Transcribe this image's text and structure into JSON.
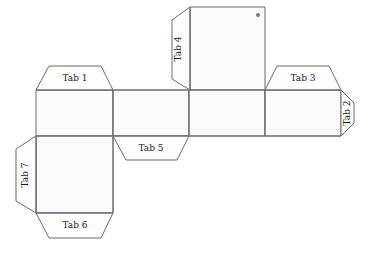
{
  "diagram": {
    "type": "papercraft-net",
    "colors": {
      "stroke": "#6b6b6b",
      "face_fill": "#fbfbfb",
      "tab_fill": "#fefefe",
      "label_text": "#1a1a1a",
      "marker_dot": "#7a7a7a",
      "background": "#ffffff"
    },
    "tabs": [
      {
        "id": "tab-1",
        "label": "Tab 1",
        "orientation": "horizontal",
        "position": "top-of-left-face"
      },
      {
        "id": "tab-2",
        "label": "Tab 2",
        "orientation": "vertical",
        "position": "right-of-right-face"
      },
      {
        "id": "tab-3",
        "label": "Tab 3",
        "orientation": "horizontal",
        "position": "top-of-right-face"
      },
      {
        "id": "tab-4",
        "label": "Tab 4",
        "orientation": "vertical",
        "position": "left-of-top-face"
      },
      {
        "id": "tab-5",
        "label": "Tab 5",
        "orientation": "horizontal",
        "position": "bottom-of-second-face"
      },
      {
        "id": "tab-6",
        "label": "Tab 6",
        "orientation": "horizontal",
        "position": "bottom-of-bottom-left-face"
      },
      {
        "id": "tab-7",
        "label": "Tab 7",
        "orientation": "vertical",
        "position": "left-of-bottom-left-face"
      }
    ],
    "faces": [
      {
        "id": "face-top",
        "name": "top-face"
      },
      {
        "id": "face-row-1",
        "name": "row-face-1"
      },
      {
        "id": "face-row-2",
        "name": "row-face-2"
      },
      {
        "id": "face-row-3",
        "name": "row-face-3"
      },
      {
        "id": "face-row-4",
        "name": "row-face-4"
      },
      {
        "id": "face-bottom-left",
        "name": "bottom-left-face"
      }
    ],
    "marker": {
      "name": "corner-dot",
      "visible": true
    }
  }
}
